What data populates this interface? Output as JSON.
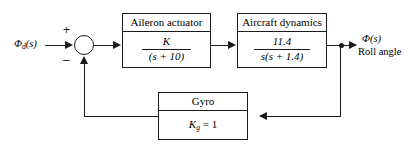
{
  "diagram": {
    "type": "control-system-block-diagram",
    "stroke_color": "#1a1a1a",
    "background_color": "#ffffff"
  },
  "input": {
    "symbol": "Φ",
    "subscript": "d",
    "argument": "(s)",
    "description": "desired roll angle command"
  },
  "output": {
    "symbol": "Φ",
    "argument": "(s)",
    "caption": "Roll angle"
  },
  "summing_junction": {
    "name": "error-summing-junction",
    "plus_sign": "+",
    "minus_sign": "–",
    "plus_input": "reference",
    "minus_input": "feedback"
  },
  "blocks": [
    {
      "id": "aileron-actuator",
      "title": "Aileron actuator",
      "numerator": "K",
      "denominator": "(s + 10)",
      "transfer_function": "K/(s + 10)"
    },
    {
      "id": "aircraft-dynamics",
      "title": "Aircraft dynamics",
      "numerator": "11.4",
      "denominator": "s(s + 1.4)",
      "transfer_function": "11.4/(s(s + 1.4))"
    },
    {
      "id": "gyro",
      "title": "Gyro",
      "gain_symbol": "K",
      "gain_subscript": "g",
      "gain_equals": "= 1",
      "transfer_function": "K_g = 1"
    }
  ],
  "signal_paths": {
    "forward": "input → sum → aileron actuator → aircraft dynamics → output",
    "feedback": "output tap → gyro → sum (negative)"
  }
}
